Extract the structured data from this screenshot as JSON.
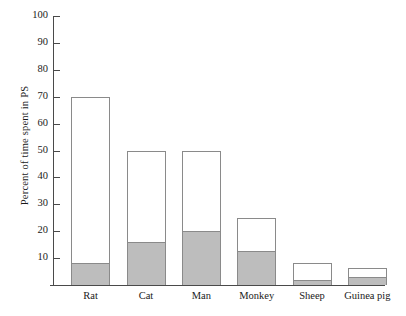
{
  "chart_data": {
    "type": "bar",
    "subtype": "stacked-bar",
    "title": "",
    "xlabel": "",
    "ylabel": "Percent of time spent in PS",
    "categories": [
      "Rat",
      "Cat",
      "Man",
      "Monkey",
      "Sheep",
      "Guinea pig"
    ],
    "series": [
      {
        "name": "lower-segment",
        "color": "#bdbdbd",
        "values": [
          8,
          16,
          20,
          12.5,
          2,
          3
        ]
      },
      {
        "name": "upper-segment",
        "color": "#ffffff",
        "values": [
          62,
          34,
          30,
          12.5,
          6,
          3.5
        ]
      }
    ],
    "totals": [
      70,
      50,
      50,
      25,
      8,
      6.5
    ],
    "ylim": [
      0,
      100
    ],
    "yticks": [
      10,
      20,
      30,
      40,
      50,
      60,
      70,
      80,
      90,
      100
    ],
    "ytick_labels": [
      "10",
      "20",
      "30",
      "40",
      "50",
      "60",
      "70",
      "80",
      "90",
      "100"
    ],
    "grid": false,
    "legend": "none",
    "annotations": []
  },
  "axis": {
    "y_label": "Percent of time spent in PS",
    "tick_labels": [
      "100",
      "90",
      "80",
      "70",
      "60",
      "50",
      "40",
      "30",
      "20",
      "10"
    ]
  },
  "colors": {
    "bar_fill_lower": "#bdbdbd",
    "bar_fill_upper": "#ffffff",
    "bar_stroke": "#8a8a8a",
    "axis": "#4a4a4a",
    "text": "#1a1a1a",
    "background": "#ffffff"
  }
}
